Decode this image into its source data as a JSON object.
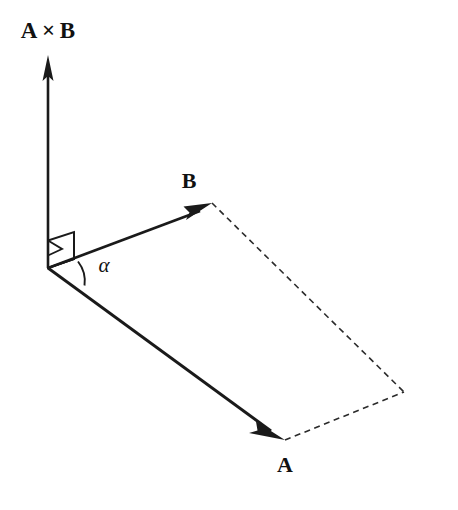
{
  "figure": {
    "background_color": "#ffffff",
    "ink_color": "#1a1a1a",
    "dash_color": "#2b2b2b",
    "width": 458,
    "height": 510
  },
  "labels": {
    "cross_product": "A × B",
    "vector_b": "B",
    "vector_a": "A",
    "angle": "α"
  },
  "label_positions": {
    "cross_product": {
      "x": 48,
      "y": 38,
      "size": 23
    },
    "vector_b": {
      "x": 189,
      "y": 188,
      "size": 22
    },
    "vector_a": {
      "x": 285,
      "y": 472,
      "size": 22
    },
    "angle": {
      "x": 104,
      "y": 272,
      "size": 21
    }
  },
  "geometry": {
    "origin": {
      "x": 48,
      "y": 268
    },
    "cross_tip": {
      "x": 48,
      "y": 55
    },
    "b_tip": {
      "x": 212,
      "y": 203
    },
    "a_tip": {
      "x": 285,
      "y": 440
    },
    "far_corner": {
      "x": 404,
      "y": 392
    },
    "shaft_width": 2.6,
    "dash_width": 1.6,
    "dash_pattern": "6,4.5"
  },
  "arrowheads": {
    "cross_product": "M48,55 L42.5,81 L48,76 L53.5,81 Z",
    "vector_b": "M212,203 L183.5,206.5 L189.5,212.5 L186,220 Z",
    "vector_a": "M285,440 L256,421.5 L257.5,430.5 L249,433 Z"
  },
  "angle_arc": {
    "path": "M78,261.5 A32,32 0 0,1 84.5,285.5",
    "stroke_width": 1.9
  },
  "perpendicular_marker": {
    "outer_path": "M48,268 L48,240.5 L74,232 L74,259 Z",
    "inner_path": "M48,268 L74,259 L74,232",
    "wedge_path": "M48,240.5 L62,249 L48,255.5",
    "stroke_width": 1.9
  },
  "dashed_edges": [
    {
      "name": "b-to-far",
      "x1": 212,
      "y1": 203,
      "x2": 404,
      "y2": 392
    },
    {
      "name": "a-to-far",
      "x1": 285,
      "y1": 440,
      "x2": 404,
      "y2": 392
    }
  ],
  "vectors": [
    {
      "name": "cross-product",
      "label": "A × B",
      "from": "origin",
      "to": "cross_tip"
    },
    {
      "name": "vector-b",
      "label": "B",
      "from": "origin",
      "to": "b_tip"
    },
    {
      "name": "vector-a",
      "label": "A",
      "from": "origin",
      "to": "a_tip"
    }
  ]
}
